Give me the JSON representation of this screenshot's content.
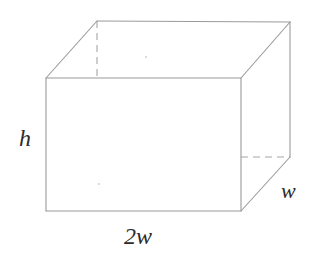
{
  "figure": {
    "background_color": "#ffffff",
    "line_color": "#9a9a9a",
    "hidden_line_color": "#a5a5a5",
    "label_color": "#2b2b2b",
    "shape": "rectangular-prism",
    "canvas": {
      "width": 318,
      "height": 261
    }
  },
  "labels": {
    "height": "h",
    "length": "2w",
    "depth": "w"
  },
  "geometry": {
    "front_face": {
      "top_left": [
        46,
        78
      ],
      "top_right": [
        241,
        78
      ],
      "bottom_right": [
        241,
        211
      ],
      "bottom_left": [
        46,
        211
      ]
    },
    "back_face": {
      "top_left": [
        97,
        21
      ],
      "top_right": [
        290,
        22
      ],
      "bottom_right": [
        290,
        157
      ],
      "bottom_left": [
        97,
        157
      ]
    },
    "hidden_edges": [
      "back-left-vertical",
      "back-bottom-horizontal",
      "bottom-left-diagonal"
    ],
    "solid_edges": [
      "front-top",
      "front-right",
      "front-bottom",
      "front-left",
      "back-top",
      "back-right-vertical",
      "top-left-diagonal",
      "top-right-diagonal",
      "bottom-right-diagonal"
    ]
  }
}
